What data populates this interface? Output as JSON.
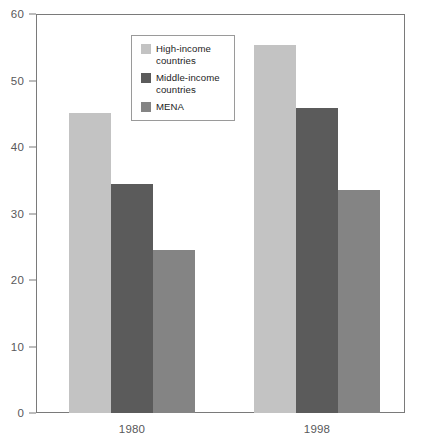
{
  "chart_data": {
    "type": "bar",
    "title": "",
    "xlabel": "",
    "ylabel": "",
    "categories": [
      "1980",
      "1998"
    ],
    "ylim": [
      0,
      60
    ],
    "yticks": [
      0,
      10,
      20,
      30,
      40,
      50,
      60
    ],
    "grid": false,
    "legend_position": "upper-left-inside",
    "series": [
      {
        "name": "High-income countries",
        "color": "#c3c3c3",
        "values": [
          45.1,
          55.3
        ]
      },
      {
        "name": "Middle-income countries",
        "color": "#5b5b5b",
        "values": [
          34.4,
          45.9
        ]
      },
      {
        "name": "MENA",
        "color": "#848484",
        "values": [
          24.5,
          33.5
        ]
      }
    ]
  },
  "axis": {
    "y_tick_labels": [
      "60",
      "50",
      "40",
      "30",
      "20",
      "10",
      "0"
    ],
    "x_tick_labels": [
      "1980",
      "1998"
    ]
  },
  "legend": {
    "entries": [
      {
        "label": "High-income countries"
      },
      {
        "label": "Middle-income countries"
      },
      {
        "label": "MENA"
      }
    ]
  },
  "colors": {
    "high_income": "#c3c3c3",
    "middle_income": "#5b5b5b",
    "mena": "#848484",
    "axis": "#7a7a7a",
    "tick_text": "#58585a",
    "legend_text": "#1c1c1c"
  }
}
